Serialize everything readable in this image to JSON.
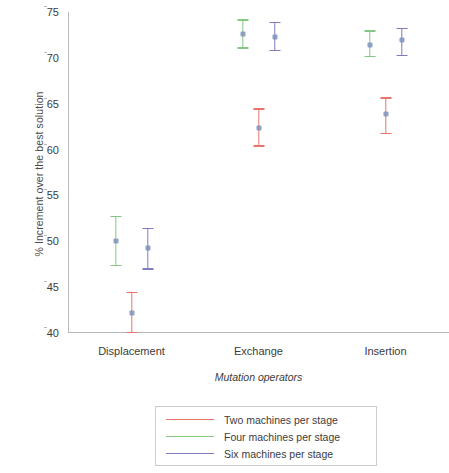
{
  "chart_data": {
    "type": "scatter",
    "title": "",
    "xlabel": "Mutation operators",
    "ylabel": "% Increment over the best solution",
    "categories": [
      "Displacement",
      "Exchange",
      "Insertion"
    ],
    "ylim": [
      40,
      75
    ],
    "yticks": [
      40,
      45,
      50,
      55,
      60,
      65,
      70,
      75
    ],
    "grid": false,
    "legend_position": "below",
    "series": [
      {
        "name": "Two machines per stage",
        "color": "#e8746c",
        "values": [
          42.2,
          62.4,
          63.9
        ],
        "lower": [
          40.0,
          60.3,
          61.7
        ],
        "upper": [
          44.5,
          64.5,
          65.7
        ]
      },
      {
        "name": "Four machines per stage",
        "color": "#84c884",
        "values": [
          50.0,
          72.6,
          71.4
        ],
        "lower": [
          47.3,
          71.0,
          70.1
        ],
        "upper": [
          52.8,
          74.2,
          73.0
        ]
      },
      {
        "name": "Six machines per stage",
        "color": "#7d7dbe",
        "values": [
          49.3,
          72.3,
          71.9
        ],
        "lower": [
          46.9,
          70.7,
          70.2
        ],
        "upper": [
          51.5,
          73.9,
          73.3
        ]
      }
    ]
  },
  "axis": {
    "y_title": "% Increment over the best solution",
    "x_title": "Mutation operators",
    "y_tick_labels": [
      "75",
      "70",
      "65",
      "60",
      "55",
      "50",
      "45",
      "40"
    ],
    "x_tick_labels": [
      "Displacement",
      "Exchange",
      "Insertion"
    ]
  },
  "legend": {
    "items": [
      {
        "label": "Two machines per stage",
        "color": "#e8746c"
      },
      {
        "label": "Four machines per stage",
        "color": "#84c884"
      },
      {
        "label": "Six machines per stage",
        "color": "#7d7dbe"
      }
    ]
  }
}
